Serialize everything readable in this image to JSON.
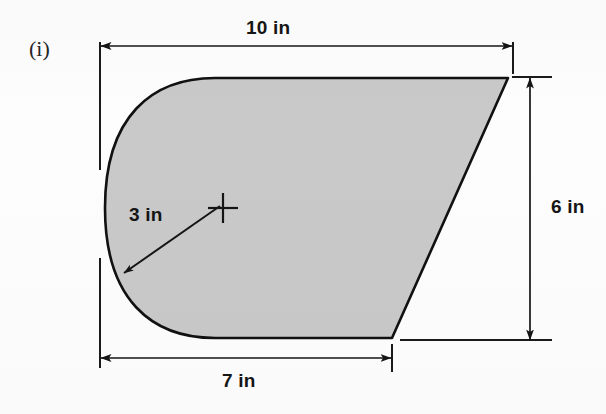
{
  "figure": {
    "part_label": "(i)",
    "shape_description": "plane region with rounded left end, horizontal top and bottom edges and a slanted right edge",
    "fill_color": "#c9c9c9",
    "outline_color": "#111111",
    "background_color": "#fdfdfd",
    "dimensions": [
      {
        "name": "top-width",
        "value": "10 in",
        "orientation": "horizontal",
        "position": "top"
      },
      {
        "name": "right-height",
        "value": "6 in",
        "orientation": "vertical",
        "position": "right"
      },
      {
        "name": "bottom-width",
        "value": "7 in",
        "orientation": "horizontal",
        "position": "bottom"
      },
      {
        "name": "arc-radius",
        "value": "3 in",
        "orientation": "diagonal",
        "position": "interior-left"
      }
    ],
    "center_mark": {
      "name": "arc-center-cross",
      "x": 222,
      "y": 208
    },
    "geometry": {
      "top_edge_y": 78,
      "bottom_edge_y": 338,
      "top_right_x": 508,
      "bottom_right_x": 392,
      "arc_start_x": 215,
      "arc_leftmost_x": 105
    }
  }
}
